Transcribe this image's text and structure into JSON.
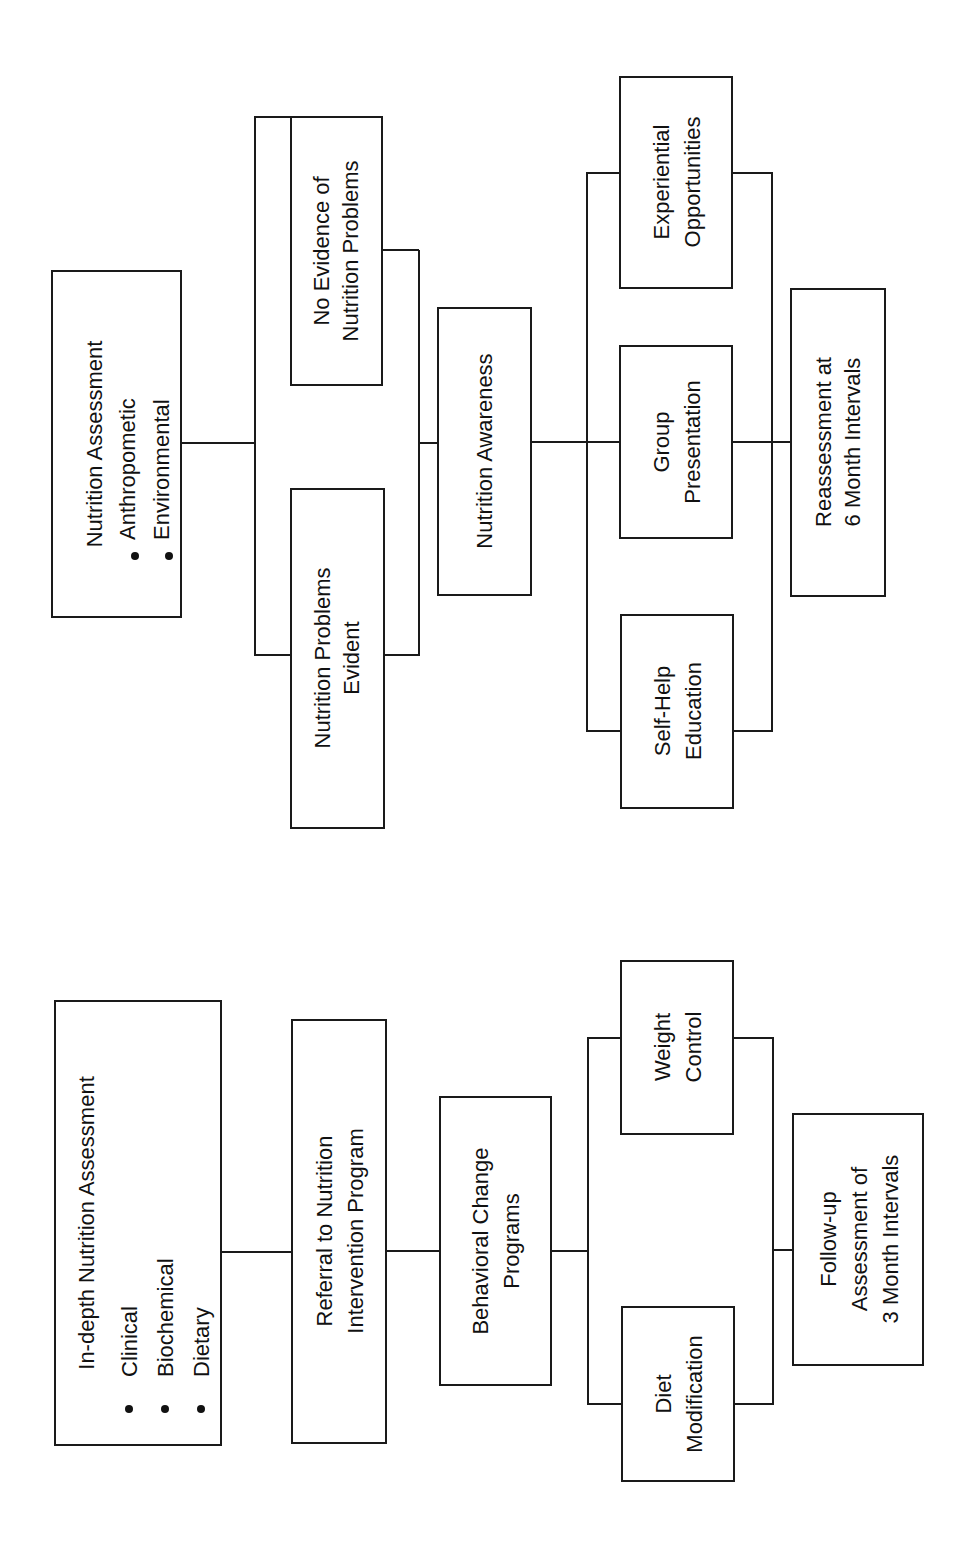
{
  "diagram_top": {
    "title": "Nutrition screening flow",
    "assessment": {
      "title": "Nutrition Assessment",
      "bullets": [
        "Anthropometic",
        "Environmental"
      ]
    },
    "branch_no_evidence": [
      "No Evidence of",
      "Nutrition Problems"
    ],
    "branch_evident": [
      "Nutrition Problems",
      "Evident"
    ],
    "awareness": "Nutrition Awareness",
    "options": {
      "experiential": [
        "Experiential",
        "Opportunities"
      ],
      "group": [
        "Group",
        "Presentation"
      ],
      "self_help": [
        "Self-Help",
        "Education"
      ]
    },
    "reassessment": [
      "Reassessment at",
      "6 Month Intervals"
    ]
  },
  "diagram_bottom": {
    "title": "Nutrition intervention flow",
    "assessment": {
      "title": "In-depth Nutrition Assessment",
      "bullets": [
        "Clinical",
        "Biochemical",
        "Dietary"
      ]
    },
    "referral": [
      "Referral to Nutrition",
      "Intervention Program"
    ],
    "behavioral": [
      "Behavioral Change",
      "Programs"
    ],
    "options": {
      "weight": [
        "Weight",
        "Control"
      ],
      "diet": [
        "Diet",
        "Modification"
      ]
    },
    "followup": [
      "Follow-up",
      "Assessment of",
      "3 Month Intervals"
    ]
  },
  "colors": {
    "line": "#1a1a1a",
    "background": "#ffffff"
  }
}
